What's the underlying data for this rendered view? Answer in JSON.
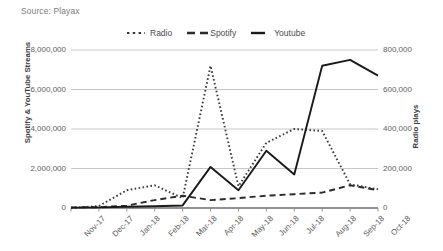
{
  "source": {
    "text": "Source: Playax"
  },
  "legend": {
    "position": "top-center",
    "entries": [
      {
        "label": "Radio",
        "style": "dotted"
      },
      {
        "label": "Spotify",
        "style": "dashed"
      },
      {
        "label": "Youtube",
        "style": "solid"
      }
    ]
  },
  "axes": {
    "left_title": "Spotify & YouTube Streams",
    "right_title": "Radio plays",
    "left_ticks": [
      "0",
      "2,000,000",
      "4,000,000",
      "6,000,000",
      "8,000,000"
    ],
    "right_ticks": [
      "0",
      "200,000",
      "400,000",
      "600,000",
      "800,000"
    ]
  },
  "chart_data": {
    "type": "line",
    "title": "",
    "subtitle": "",
    "xlabel": "",
    "ylabel": "Spotify & YouTube Streams",
    "y2label": "Radio plays",
    "ylim": [
      0,
      8000000
    ],
    "y2lim": [
      0,
      800000
    ],
    "grid": true,
    "legend_position": "top-center",
    "categories": [
      "Nov-17",
      "Dec-17",
      "Jan-18",
      "Feb-18",
      "Mar-18",
      "Apr-18",
      "May-18",
      "Jun-18",
      "Jul-18",
      "Aug-18",
      "Sep-18",
      "Oct-18"
    ],
    "series": [
      {
        "name": "Radio",
        "axis": "right",
        "style": "dotted",
        "color": "#3a3a3a",
        "values": [
          0,
          10000,
          90000,
          115000,
          50000,
          720000,
          110000,
          330000,
          400000,
          390000,
          120000,
          95000
        ]
      },
      {
        "name": "Spotify",
        "axis": "left",
        "style": "dashed",
        "color": "#2b2b2b",
        "values": [
          30000,
          40000,
          120000,
          400000,
          620000,
          400000,
          500000,
          620000,
          700000,
          780000,
          1150000,
          900000
        ]
      },
      {
        "name": "Youtube",
        "axis": "left",
        "style": "solid",
        "color": "#1a1a1a",
        "values": [
          20000,
          30000,
          60000,
          90000,
          130000,
          2080000,
          900000,
          2900000,
          1700000,
          7200000,
          7500000,
          6700000
        ]
      }
    ]
  }
}
